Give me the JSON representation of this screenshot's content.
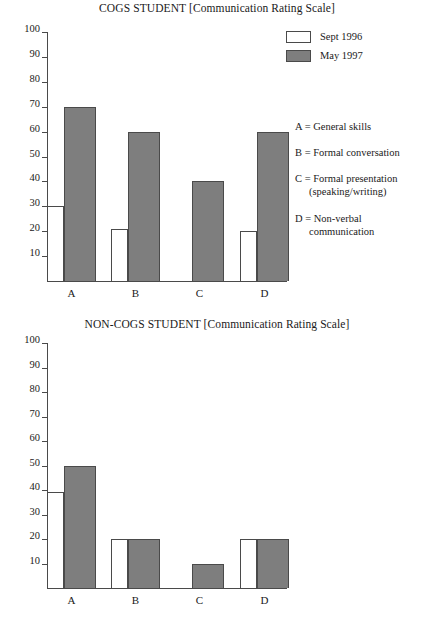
{
  "charts": [
    {
      "id": "cogs",
      "title": "COGS STUDENT [Communication Rating Scale]",
      "ticks": [
        "100",
        "90",
        "80",
        "70",
        "60",
        "50",
        "40",
        "30",
        "20",
        "10"
      ],
      "categories": [
        "A",
        "B",
        "C",
        "D"
      ]
    },
    {
      "id": "non-cogs",
      "title": "NON-COGS STUDENT [Communication Rating Scale]",
      "ticks": [
        "100",
        "90",
        "80",
        "70",
        "60",
        "50",
        "40",
        "30",
        "20",
        "10"
      ],
      "categories": [
        "A",
        "B",
        "C",
        "D"
      ]
    }
  ],
  "legend": {
    "entries": [
      {
        "label": "Sept 1996",
        "swatch": "#ffffff",
        "swatch_name": "sept-1996-swatch"
      },
      {
        "label": "May 1997",
        "swatch": "#7e7e7e",
        "swatch_name": "may-1997-swatch"
      }
    ]
  },
  "key": {
    "items": [
      {
        "line1": "A = General skills",
        "line2": ""
      },
      {
        "line1": "B = Formal conversation",
        "line2": ""
      },
      {
        "line1": "C = Formal presentation",
        "line2": "(speaking/writing)"
      },
      {
        "line1": "D = Non-verbal",
        "line2": "communication"
      }
    ]
  },
  "colors": {
    "may_1997_fill": "#7e7e7e",
    "sept_1996_fill": "#ffffff",
    "axis": "#4a4a4a",
    "text": "#1a1a1a",
    "background": "#ffffff"
  },
  "chart_data": [
    {
      "type": "bar",
      "title": "COGS STUDENT [Communication Rating Scale]",
      "xlabel": "",
      "ylabel": "",
      "ylim": [
        0,
        100
      ],
      "yticks": [
        10,
        20,
        30,
        40,
        50,
        60,
        70,
        80,
        90,
        100
      ],
      "grid": false,
      "legend_position": "top-right",
      "categories": [
        "A",
        "B",
        "C",
        "D"
      ],
      "category_key": {
        "A": "General skills",
        "B": "Formal conversation",
        "C": "Formal presentation (speaking/writing)",
        "D": "Non-verbal communication"
      },
      "series": [
        {
          "name": "Sept 1996",
          "values": [
            30,
            21,
            0,
            20
          ]
        },
        {
          "name": "May 1997",
          "values": [
            70,
            60,
            40,
            60
          ]
        }
      ]
    },
    {
      "type": "bar",
      "title": "NON-COGS STUDENT [Communication Rating Scale]",
      "xlabel": "",
      "ylabel": "",
      "ylim": [
        0,
        100
      ],
      "yticks": [
        10,
        20,
        30,
        40,
        50,
        60,
        70,
        80,
        90,
        100
      ],
      "grid": false,
      "legend_position": "none",
      "categories": [
        "A",
        "B",
        "C",
        "D"
      ],
      "category_key": {
        "A": "General skills",
        "B": "Formal conversation",
        "C": "Formal presentation (speaking/writing)",
        "D": "Non-verbal communication"
      },
      "series": [
        {
          "name": "Sept 1996",
          "values": [
            39,
            20,
            0,
            20
          ]
        },
        {
          "name": "May 1997",
          "values": [
            50,
            20,
            10,
            20
          ]
        }
      ]
    }
  ]
}
